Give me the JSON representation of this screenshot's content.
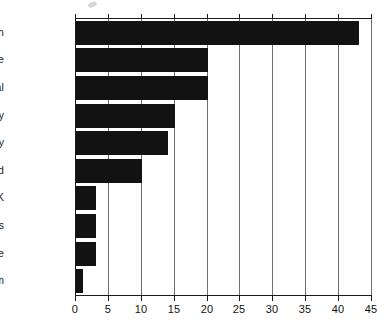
{
  "chart_data": {
    "type": "bar",
    "orientation": "horizontal",
    "title": "",
    "subtitle": "",
    "xlabel": "",
    "ylabel": "",
    "categories": [
      "Spain",
      "Greece",
      "Portugal",
      "Italy",
      "Germany",
      "Ireland",
      "UK",
      "Netherlands",
      "France",
      "Belgium"
    ],
    "values": [
      43,
      20,
      20,
      15,
      14,
      10,
      3,
      3,
      3,
      1
    ],
    "xlim": [
      0,
      45
    ],
    "xticks": [
      0,
      5,
      10,
      15,
      20,
      25,
      30,
      35,
      40,
      45
    ],
    "xtick_labels": [
      "0",
      "5",
      "10",
      "15",
      "20",
      "25",
      "30",
      "35",
      "40",
      "45"
    ],
    "grid": true,
    "grid_axis": "x",
    "legend": false,
    "bar_color": "#121212",
    "gridline_color": "#6e6e6e",
    "axis_color": "#1b1b1b",
    "background_color": "#ffffff"
  }
}
